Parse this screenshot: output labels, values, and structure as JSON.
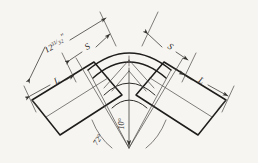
{
  "drawing": {
    "title": "Mitered duct elbow bend dimension diagram",
    "background_color": "#f7f5f1",
    "line_color": "#2e2c2a",
    "labels": {
      "overall_length": {
        "whole": "12",
        "numerator": "31",
        "denominator": "32",
        "unit": "\"",
        "full": "12 31/32\"",
        "name": "overall-length-dimension"
      },
      "segment_left": {
        "text": "S",
        "name": "segment-s-left"
      },
      "segment_right": {
        "text": "S",
        "name": "segment-s-right"
      },
      "leg_left": {
        "text": "L",
        "name": "leg-l-left"
      },
      "leg_right": {
        "text": "L",
        "name": "leg-l-right"
      },
      "angle_miter": {
        "text": "72°",
        "value": 72,
        "name": "miter-angle-72"
      },
      "angle_center": {
        "text": "10°",
        "value": 10,
        "name": "center-angle-10"
      }
    }
  }
}
